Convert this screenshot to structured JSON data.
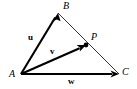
{
  "figure": {
    "background_color": "#ffffff",
    "stroke_color": "#000000",
    "width": 137,
    "height": 89
  },
  "points": [
    {
      "id": "A",
      "label": "A",
      "x": 21,
      "y": 74,
      "label_x": 9,
      "label_y": 69
    },
    {
      "id": "B",
      "label": "B",
      "x": 58,
      "y": 13,
      "label_x": 63,
      "label_y": 1
    },
    {
      "id": "C",
      "label": "C",
      "x": 119,
      "y": 74,
      "label_x": 122,
      "label_y": 67
    },
    {
      "id": "P",
      "label": "P",
      "x": 86,
      "y": 45,
      "label_x": 91,
      "label_y": 32
    }
  ],
  "vectors": [
    {
      "id": "u",
      "label": "u",
      "from": "A",
      "to": "B",
      "label_x": 28,
      "label_y": 33,
      "style": "thick-arrow"
    },
    {
      "id": "v",
      "label": "v",
      "from": "A",
      "to": "P",
      "label_x": 50,
      "label_y": 47,
      "style": "thick-arrow"
    },
    {
      "id": "w",
      "label": "w",
      "from": "A",
      "to": "C",
      "label_x": 68,
      "label_y": 77,
      "style": "thick-arrow"
    }
  ],
  "edges": [
    {
      "id": "BC",
      "from": "B",
      "to": "C",
      "style": "thin-line"
    }
  ],
  "marker_dot": {
    "at": "P",
    "radius": 2.4,
    "color": "#000000"
  }
}
